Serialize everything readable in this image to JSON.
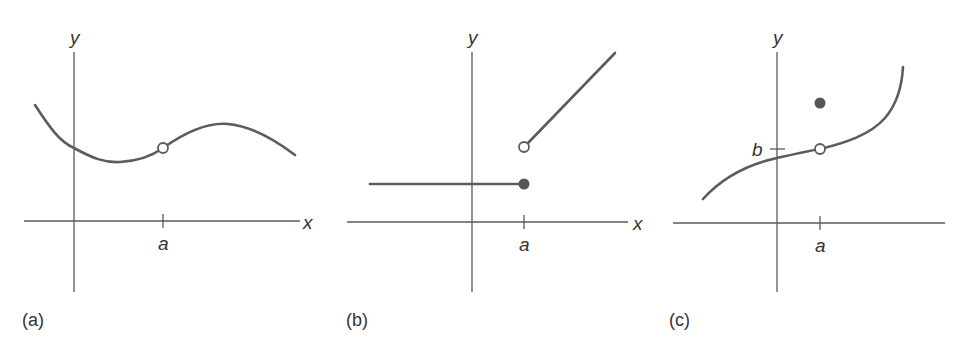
{
  "figure": {
    "colors": {
      "axis": "#5a5a5a",
      "curve": "#5c5c5c",
      "filled_dot": "#555555",
      "open_dot_fill": "#ffffff",
      "text": "#333333"
    },
    "panels": [
      {
        "id": "a",
        "label": "(a)",
        "x_axis_label": "x",
        "y_axis_label": "y",
        "tick_labels": [
          "a"
        ],
        "description": "Smooth curve with a hole (open circle) at x = a"
      },
      {
        "id": "b",
        "label": "(b)",
        "x_axis_label": "x",
        "y_axis_label": "y",
        "tick_labels": [
          "a"
        ],
        "description": "Jump discontinuity: constant line ending in filled dot at x = a; increasing line starting at open circle at x = a"
      },
      {
        "id": "c",
        "label": "(c)",
        "x_axis_label": "",
        "y_axis_label": "y",
        "tick_labels": [
          "a",
          "b"
        ],
        "description": "Increasing curve with open circle at (a, b) and a filled dot above it at x = a"
      }
    ]
  }
}
